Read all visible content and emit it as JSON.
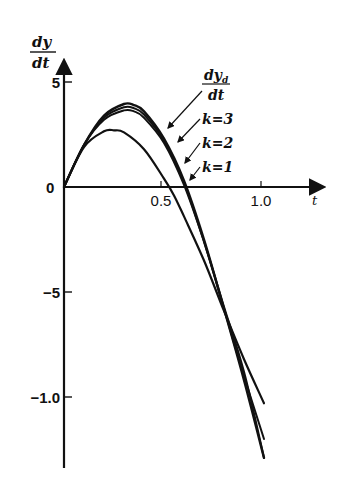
{
  "chart_data": {
    "type": "line",
    "title": "",
    "xlabel": "t",
    "ylabel_numerator": "dy",
    "ylabel_denominator": "dt",
    "xlim": [
      0,
      1.25
    ],
    "ylim": [
      -13.5,
      6
    ],
    "x_ticks": [
      {
        "value": 0.5,
        "label": "0.5"
      },
      {
        "value": 1.0,
        "label": "1.0"
      }
    ],
    "y_ticks": [
      {
        "value": 5,
        "label": "5"
      },
      {
        "value": 0,
        "label": "0"
      },
      {
        "value": -5,
        "label": "−5"
      },
      {
        "value": -10,
        "label": "−1.0"
      }
    ],
    "grid": false,
    "legend_position": "inline annotations with leader arrows (upper right of curves)",
    "series": [
      {
        "name": "dy_d/dt",
        "label_num": "dy",
        "label_sub": "d",
        "label_den": "dt",
        "style": "solid",
        "x": [
          0,
          0.1,
          0.2,
          0.3,
          0.35,
          0.4,
          0.5,
          0.6,
          0.7,
          0.8,
          0.9,
          1.0
        ],
        "values": [
          0,
          2.0,
          3.4,
          3.95,
          3.9,
          3.6,
          2.3,
          0.3,
          -2.5,
          -5.8,
          -9.2,
          -12.9
        ]
      },
      {
        "name": "k=3",
        "label": "k=3",
        "style": "solid",
        "x": [
          0,
          0.1,
          0.2,
          0.3,
          0.35,
          0.4,
          0.5,
          0.6,
          0.7,
          0.8,
          0.9,
          1.0
        ],
        "values": [
          0,
          2.0,
          3.3,
          3.8,
          3.75,
          3.45,
          2.2,
          0.2,
          -2.6,
          -5.8,
          -9.0,
          -12.0
        ]
      },
      {
        "name": "k=2",
        "label": "k=2",
        "style": "solid",
        "x": [
          0,
          0.1,
          0.2,
          0.3,
          0.35,
          0.4,
          0.5,
          0.6,
          0.7,
          0.8,
          0.9,
          1.0
        ],
        "values": [
          0,
          2.0,
          3.2,
          3.65,
          3.6,
          3.3,
          2.1,
          0.1,
          -2.6,
          -5.7,
          -8.8,
          -12.9
        ]
      },
      {
        "name": "k=1",
        "label": "k=1",
        "style": "solid, dashed tail",
        "x": [
          0,
          0.1,
          0.2,
          0.25,
          0.3,
          0.4,
          0.5,
          0.55,
          0.6,
          0.7,
          0.8,
          0.9,
          1.0
        ],
        "values": [
          0,
          1.9,
          2.65,
          2.7,
          2.6,
          1.8,
          0.4,
          -0.4,
          -1.4,
          -3.5,
          -5.9,
          -8.2,
          -10.3
        ]
      }
    ]
  }
}
